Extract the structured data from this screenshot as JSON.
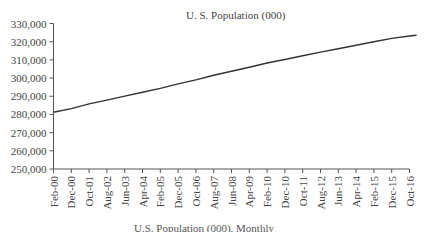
{
  "chart_data": {
    "type": "line",
    "title": "U. S. Population (000)",
    "xlabel": "",
    "ylabel": "",
    "caption": "U.S. Population (000), Monthly",
    "ylim": [
      250000,
      330000
    ],
    "y_ticks": [
      "250,000",
      "260,000",
      "270,000",
      "280,000",
      "290,000",
      "300,000",
      "310,000",
      "320,000",
      "330,000"
    ],
    "x_ticks": [
      "Feb-00",
      "Dec-00",
      "Oct-01",
      "Aug-02",
      "Jun-03",
      "Apr-04",
      "Feb-05",
      "Dec-05",
      "Oct-06",
      "Aug-07",
      "Jun-08",
      "Apr-09",
      "Feb-10",
      "Dec-10",
      "Oct-11",
      "Aug-12",
      "Jun-13",
      "Apr-14",
      "Feb-15",
      "Dec-15",
      "Oct-16"
    ],
    "grid": false,
    "legend": null,
    "series": [
      {
        "name": "U. S. Population (000)",
        "color": "#333333",
        "x": [
          "Feb-00",
          "Dec-00",
          "Oct-01",
          "Aug-02",
          "Jun-03",
          "Apr-04",
          "Feb-05",
          "Dec-05",
          "Oct-06",
          "Aug-07",
          "Jun-08",
          "Apr-09",
          "Feb-10",
          "Dec-10",
          "Oct-11",
          "Aug-12",
          "Jun-13",
          "Apr-14",
          "Feb-15",
          "Dec-15",
          "Oct-16",
          "Feb-17"
        ],
        "values": [
          281200,
          283200,
          285800,
          287900,
          290100,
          292200,
          294300,
          296800,
          299000,
          301600,
          303800,
          305900,
          308300,
          310200,
          312300,
          314300,
          316100,
          318000,
          320000,
          321800,
          323100,
          323500
        ]
      }
    ]
  }
}
